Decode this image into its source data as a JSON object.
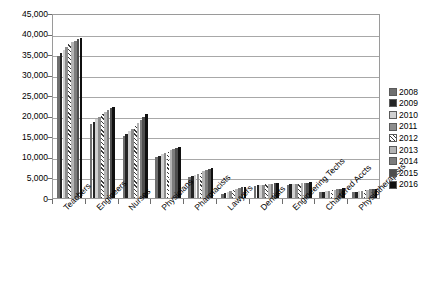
{
  "chart_data": {
    "type": "bar",
    "title": "",
    "xlabel": "",
    "ylabel": "",
    "ylim": [
      0,
      45000
    ],
    "ytick_labels": [
      "45,000",
      "40,000",
      "35,000",
      "30,000",
      "25,000",
      "20,000",
      "15,000",
      "10,000",
      "5,000",
      "0"
    ],
    "ytick_values": [
      45000,
      40000,
      35000,
      30000,
      25000,
      20000,
      15000,
      10000,
      5000,
      0
    ],
    "grid": true,
    "legend_position": "right",
    "categories": [
      "Teachers",
      "Engineers",
      "Nurses",
      "Physicians",
      "Pharmacists",
      "Lawyers",
      "Dentists",
      "Engineering Techs",
      "Chartered Accts",
      "Physiotherapists"
    ],
    "series": [
      {
        "name": "2008",
        "values": [
          34500,
          18000,
          15200,
          10000,
          5100,
          1000,
          3000,
          3200,
          1400,
          1400
        ]
      },
      {
        "name": "2009",
        "values": [
          35200,
          18600,
          15600,
          10300,
          5300,
          1250,
          3080,
          3300,
          1500,
          1500
        ]
      },
      {
        "name": "2010",
        "values": [
          36000,
          19200,
          16200,
          10600,
          5600,
          1500,
          3150,
          3380,
          1620,
          1620
        ]
      },
      {
        "name": "2011",
        "values": [
          36800,
          19800,
          16900,
          10900,
          5900,
          1800,
          3240,
          3450,
          1750,
          1740
        ]
      },
      {
        "name": "2012",
        "values": [
          37400,
          20400,
          17600,
          11300,
          6200,
          2050,
          3320,
          3520,
          1880,
          1860
        ]
      },
      {
        "name": "2013",
        "values": [
          37900,
          20900,
          18300,
          11600,
          6500,
          2300,
          3400,
          3600,
          2000,
          1980
        ]
      },
      {
        "name": "2014",
        "values": [
          38300,
          21400,
          19000,
          11900,
          6800,
          2500,
          3470,
          3670,
          2130,
          2090
        ]
      },
      {
        "name": "2015",
        "values": [
          38700,
          21800,
          19700,
          12200,
          7100,
          2680,
          3540,
          3730,
          2260,
          2200
        ]
      },
      {
        "name": "2016",
        "values": [
          39000,
          22200,
          20500,
          12500,
          7400,
          2800,
          3600,
          3800,
          2400,
          2300
        ]
      }
    ]
  },
  "legend": {
    "entries": [
      "2008",
      "2009",
      "2010",
      "2011",
      "2012",
      "2013",
      "2014",
      "2015",
      "2016"
    ]
  }
}
